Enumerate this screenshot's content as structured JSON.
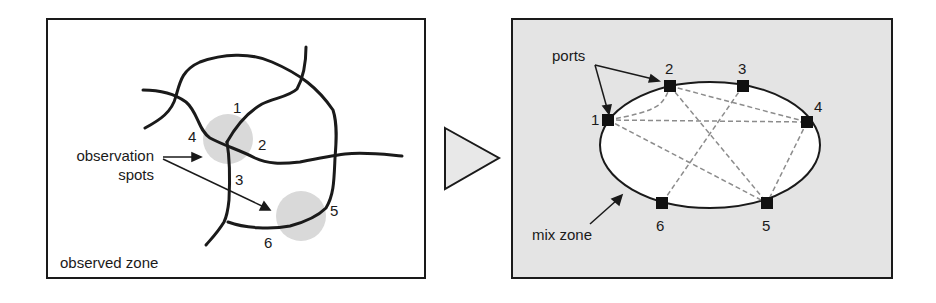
{
  "colors": {
    "stroke": "#1a1a1a",
    "spot": "#d9d9d9",
    "right_bg": "#e4e4e4",
    "ellipse_fill": "#ffffff",
    "dashed": "#8c8c8c",
    "triangle_fill": "#e8e8e8"
  },
  "left_panel": {
    "caption": "observed zone",
    "annotation_line1": "observation",
    "annotation_line2": "spots",
    "road_labels": [
      "1",
      "2",
      "3",
      "4",
      "5",
      "6"
    ]
  },
  "arrow": {
    "shape": "triangle-right"
  },
  "right_panel": {
    "ports_label": "ports",
    "mix_zone_label": "mix zone",
    "port_labels": [
      "1",
      "2",
      "3",
      "4",
      "5",
      "6"
    ],
    "connections": [
      [
        "1",
        "2"
      ],
      [
        "1",
        "4"
      ],
      [
        "1",
        "5"
      ],
      [
        "2",
        "4"
      ],
      [
        "2",
        "5"
      ],
      [
        "3",
        "6"
      ],
      [
        "4",
        "5"
      ]
    ]
  }
}
